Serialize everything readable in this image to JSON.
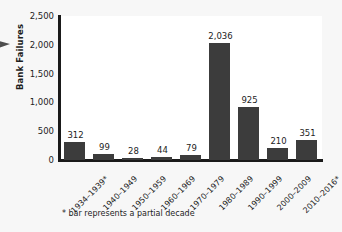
{
  "chart_data": {
    "type": "bar",
    "title": "",
    "xlabel": "",
    "ylabel": "Bank Failures",
    "categories": [
      "1934–1939*",
      "1940–1949",
      "1950–1959",
      "1960–1969",
      "1970–1979",
      "1980–1989",
      "1990–1999",
      "2000–2009",
      "2010–2016*"
    ],
    "values": [
      312,
      99,
      28,
      44,
      79,
      2036,
      925,
      210,
      351
    ],
    "value_labels": [
      "312",
      "99",
      "28",
      "44",
      "79",
      "2,036",
      "925",
      "210",
      "351"
    ],
    "ylim": [
      0,
      2500
    ],
    "yticks": [
      0,
      500,
      1000,
      1500,
      2000,
      2500
    ],
    "ytick_labels": [
      "0",
      "500",
      "1,000",
      "1,500",
      "2,000",
      "2,500"
    ],
    "grid": false,
    "legend": false,
    "bar_color": "#3c3c3c",
    "axis_color": "#1a1a1a",
    "text_color": "#1d1d1d",
    "plot_background": "#ffffff",
    "figure_background": "#f7f7f7"
  },
  "footnote": "* bar represents a partial decade"
}
